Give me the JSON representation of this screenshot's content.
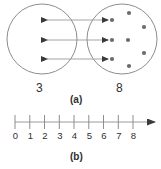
{
  "figure": {
    "panel_a": {
      "caption": "(a)",
      "left_set": {
        "size_label": "3",
        "dot_count": 3,
        "dots": [
          {
            "cx": 43,
            "cy": 20
          },
          {
            "cx": 43,
            "cy": 40
          },
          {
            "cx": 43,
            "cy": 59
          }
        ],
        "circle": {
          "cx": 42,
          "cy": 39,
          "r": 35
        }
      },
      "right_set": {
        "size_label": "8",
        "dot_count": 8,
        "dots": [
          {
            "cx": 112,
            "cy": 20
          },
          {
            "cx": 112,
            "cy": 40
          },
          {
            "cx": 112,
            "cy": 59
          },
          {
            "cx": 128,
            "cy": 40
          },
          {
            "cx": 129,
            "cy": 13
          },
          {
            "cx": 144,
            "cy": 27
          },
          {
            "cx": 144,
            "cy": 53
          },
          {
            "cx": 129,
            "cy": 66
          }
        ],
        "circle": {
          "cx": 122,
          "cy": 39,
          "r": 35
        }
      },
      "correspondence_arrows": [
        {
          "y": 20,
          "x1": 47,
          "x2": 108,
          "double_headed": true
        },
        {
          "y": 40,
          "x1": 47,
          "x2": 108,
          "double_headed": true
        },
        {
          "y": 59,
          "x1": 47,
          "x2": 108,
          "double_headed": true
        }
      ]
    },
    "panel_b": {
      "caption": "(b)",
      "number_line": {
        "ticks": [
          "0",
          "1",
          "2",
          "3",
          "4",
          "5",
          "6",
          "7",
          "8"
        ],
        "min": 0,
        "max": 8,
        "has_right_arrow": true,
        "axis_y": 122,
        "x_start": 15,
        "x_end": 133,
        "arrow_tip_x": 155
      }
    }
  },
  "colors": {
    "ink": "#2f2f2f",
    "line": "#9a9a9a",
    "dot": "#6b6b6b",
    "circle_stroke": "#8d8d8d",
    "background": "#ffffff"
  }
}
